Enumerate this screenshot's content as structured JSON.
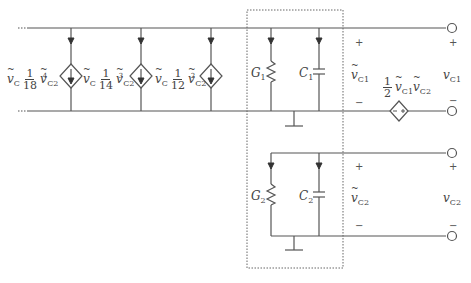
{
  "diagram": {
    "type": "circuit",
    "colors": {
      "wire": "#555555",
      "box": "#666666",
      "text": "#444444"
    },
    "dependent_current_sources": [
      {
        "id": "src1",
        "label": {
          "prefix": "v",
          "prefix_sub": "C",
          "num": "1",
          "den": "18",
          "var": "v",
          "var_sub": "C2",
          "var_sup": "4"
        }
      },
      {
        "id": "src2",
        "label": {
          "prefix": "v",
          "prefix_sub": "C",
          "num": "1",
          "den": "14",
          "var": "v",
          "var_sub": "C2",
          "var_sup": "3"
        }
      },
      {
        "id": "src3",
        "label": {
          "prefix": "v",
          "prefix_sub": "C",
          "num": "1",
          "den": "12",
          "var": "v",
          "var_sub": "C2",
          "var_sup": "2"
        }
      }
    ],
    "subcircuit_1": {
      "resistor": {
        "name": "G",
        "sub": "1"
      },
      "capacitor": {
        "name": "C",
        "sub": "1"
      },
      "voltage": {
        "name": "v",
        "sub": "C1",
        "plus": "+",
        "minus": "−"
      }
    },
    "subcircuit_2": {
      "resistor": {
        "name": "G",
        "sub": "2"
      },
      "capacitor": {
        "name": "C",
        "sub": "2"
      },
      "voltage": {
        "name": "v",
        "sub": "C2",
        "plus": "+",
        "minus": "−"
      }
    },
    "dependent_voltage_source": {
      "num": "1",
      "den": "2",
      "var1": "v",
      "var1_sub": "C1",
      "var2": "v",
      "var2_sub": "C2",
      "inner_minus": "−",
      "inner_plus": "+"
    },
    "output_ports": [
      {
        "name": "v",
        "sub": "C1",
        "plus": "+",
        "minus": "−"
      },
      {
        "name": "v",
        "sub": "C2",
        "plus": "+",
        "minus": "−"
      }
    ]
  }
}
